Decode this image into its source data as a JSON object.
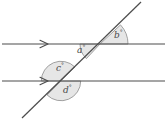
{
  "figure": {
    "colors": {
      "line": "#4d4d4d",
      "sector_fill": "#e6e6e6",
      "sector_stroke": "#8c8c8c",
      "label_text": "#4a4a4a",
      "background": "#ffffff"
    },
    "lines": [
      {
        "name": "upper-parallel-line",
        "y": 44,
        "x1": 2,
        "x2": 165,
        "arrow_at": 47,
        "arrow_direction": "right"
      },
      {
        "name": "lower-parallel-line",
        "y": 81,
        "x1": 2,
        "x2": 165,
        "arrow_at": 47,
        "arrow_direction": "right"
      },
      {
        "name": "transversal-line",
        "x1": 22,
        "y1": 118,
        "x2": 141,
        "y2": 2
      }
    ],
    "intersections": [
      {
        "name": "upper-intersection",
        "x": 100,
        "y": 44
      },
      {
        "name": "lower-intersection",
        "x": 61,
        "y": 81
      }
    ],
    "angles": [
      {
        "id": "a",
        "label": "a",
        "degree_symbol": "°",
        "vertex": "upper-intersection",
        "position": "below-left",
        "radius": 20
      },
      {
        "id": "b",
        "label": "b",
        "degree_symbol": "°",
        "vertex": "upper-intersection",
        "position": "above-right",
        "radius": 28
      },
      {
        "id": "c",
        "label": "c",
        "degree_symbol": "°",
        "vertex": "lower-intersection",
        "position": "above-left",
        "radius": 19
      },
      {
        "id": "d",
        "label": "d",
        "degree_symbol": "°",
        "vertex": "lower-intersection",
        "position": "below-left",
        "radius": 19
      }
    ]
  }
}
